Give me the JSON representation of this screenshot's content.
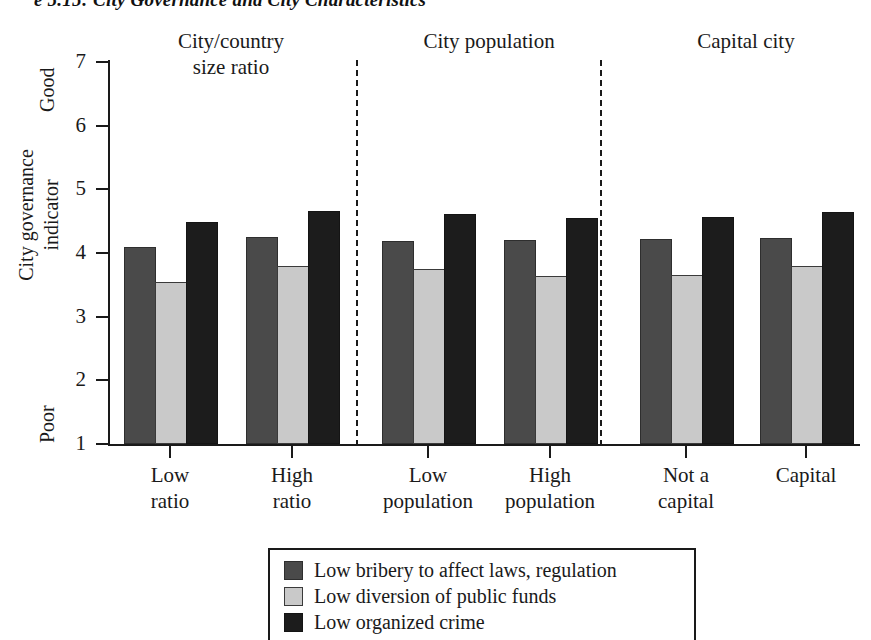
{
  "figure": {
    "title": "e 5.15:  City Governance and City Characteristics",
    "axis_top_label": "Good",
    "axis_bottom_label": "Poor",
    "yaxis_title_line1": "City governance",
    "yaxis_title_line2": "indicator"
  },
  "groups": [
    {
      "header_line1": "City/country",
      "header_line2": "size ratio"
    },
    {
      "header_line1": "City population",
      "header_line2": ""
    },
    {
      "header_line1": "Capital city",
      "header_line2": ""
    }
  ],
  "legend": {
    "items": [
      {
        "label": "Low bribery to affect laws, regulation",
        "color": "#4a4a4a",
        "swatch": "series-0-swatch"
      },
      {
        "label": "Low diversion of public funds",
        "color": "#c9c9c9",
        "swatch": "series-1-swatch"
      },
      {
        "label": "Low organized crime",
        "color": "#1c1c1c",
        "swatch": "series-2-swatch"
      }
    ]
  },
  "chart_data": {
    "type": "bar",
    "title": "City Governance and City Characteristics",
    "xlabel": "",
    "ylabel": "City governance indicator",
    "ylim": [
      1,
      7
    ],
    "yticks": [
      1,
      2,
      3,
      4,
      5,
      6,
      7
    ],
    "ytick_labels": [
      "1",
      "2",
      "3",
      "4",
      "5",
      "6",
      "7"
    ],
    "y_axis_low_annotation": "Poor",
    "y_axis_high_annotation": "Good",
    "grid": false,
    "legend_position": "bottom-center",
    "group_headers": [
      "City/country size ratio",
      "City population",
      "Capital city"
    ],
    "group_separators_after": [
      "High ratio",
      "High population"
    ],
    "categories": [
      "Low ratio",
      "High ratio",
      "Low population",
      "High population",
      "Not a capital",
      "Capital"
    ],
    "category_label_lines": [
      [
        "Low",
        "ratio"
      ],
      [
        "High",
        "ratio"
      ],
      [
        "Low",
        "population"
      ],
      [
        "High",
        "population"
      ],
      [
        "Not a",
        "capital"
      ],
      [
        "Capital",
        ""
      ]
    ],
    "series": [
      {
        "name": "Low bribery to affect laws, regulation",
        "color": "#4a4a4a",
        "values": [
          4.06,
          4.22,
          4.15,
          4.18,
          4.19,
          4.21
        ]
      },
      {
        "name": "Low diversion of public funds",
        "color": "#c9c9c9",
        "values": [
          3.52,
          3.77,
          3.72,
          3.61,
          3.62,
          3.76
        ]
      },
      {
        "name": "Low organized crime",
        "color": "#1c1c1c",
        "values": [
          4.45,
          4.63,
          4.58,
          4.52,
          4.53,
          4.62
        ]
      }
    ]
  }
}
